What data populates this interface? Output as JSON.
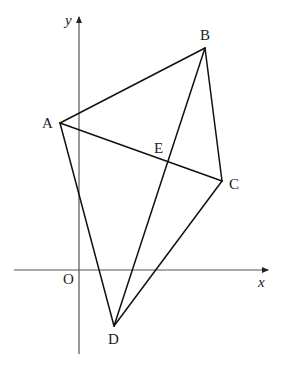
{
  "diagram": {
    "type": "coordinate-geometry",
    "colors": {
      "lines": "#111111",
      "axes": "#555555",
      "background": "#ffffff"
    },
    "axes": {
      "x_label": "x",
      "y_label": "y",
      "origin_label": "O",
      "x_axis": {
        "x1": 14,
        "x2": 268,
        "y": 270
      },
      "y_axis": {
        "x": 79,
        "y1": 354,
        "y2": 17
      }
    },
    "points": [
      {
        "name": "A",
        "x": 60,
        "y": 123,
        "label": "A",
        "lx": 42,
        "ly": 128
      },
      {
        "name": "B",
        "x": 205,
        "y": 48,
        "label": "B",
        "lx": 200,
        "ly": 40
      },
      {
        "name": "C",
        "x": 222,
        "y": 181,
        "label": "C",
        "lx": 229,
        "ly": 189
      },
      {
        "name": "D",
        "x": 114,
        "y": 326,
        "label": "D",
        "lx": 108,
        "ly": 344
      },
      {
        "name": "E",
        "x": 167,
        "y": 161,
        "label": "E",
        "lx": 154,
        "ly": 153
      }
    ],
    "segments": [
      [
        "A",
        "B"
      ],
      [
        "B",
        "C"
      ],
      [
        "C",
        "D"
      ],
      [
        "D",
        "A"
      ],
      [
        "A",
        "C"
      ],
      [
        "B",
        "D"
      ]
    ],
    "origin_label_pos": {
      "x": 63,
      "y": 284
    },
    "x_label_pos": {
      "x": 258,
      "y": 287
    },
    "y_label_pos": {
      "x": 65,
      "y": 25
    }
  }
}
